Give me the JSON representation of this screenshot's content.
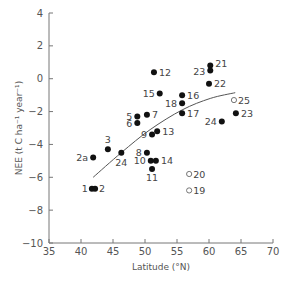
{
  "chart_data": {
    "type": "scatter",
    "title": "",
    "xlabel": "Latitude (°N)",
    "ylabel": "NEE (t C ha⁻¹ year⁻¹)",
    "xlim": [
      35,
      70
    ],
    "ylim": [
      -10,
      4
    ],
    "xticks": [
      35,
      40,
      45,
      50,
      55,
      60,
      65,
      70
    ],
    "yticks": [
      4,
      2,
      0,
      -2,
      -4,
      -6,
      -8,
      -10
    ],
    "grid": false,
    "legend": null,
    "series": [
      {
        "name": "filled",
        "marker": "filled-circle",
        "points": [
          {
            "label": "1",
            "x": 41.7,
            "y": -6.7
          },
          {
            "label": "2",
            "x": 42.2,
            "y": -6.7
          },
          {
            "label": "2a",
            "x": 41.9,
            "y": -4.8
          },
          {
            "label": "3",
            "x": 44.2,
            "y": -4.3
          },
          {
            "label": "24",
            "x": 46.3,
            "y": -4.5
          },
          {
            "label": "5",
            "x": 48.8,
            "y": -2.3
          },
          {
            "label": "6",
            "x": 48.8,
            "y": -2.7
          },
          {
            "label": "7",
            "x": 50.3,
            "y": -2.2
          },
          {
            "label": "8",
            "x": 50.3,
            "y": -4.5
          },
          {
            "label": "9",
            "x": 51.1,
            "y": -3.4
          },
          {
            "label": "10",
            "x": 50.9,
            "y": -5.0
          },
          {
            "label": "11",
            "x": 51.1,
            "y": -5.5
          },
          {
            "label": "12",
            "x": 51.4,
            "y": 0.4
          },
          {
            "label": "13",
            "x": 51.9,
            "y": -3.2
          },
          {
            "label": "14",
            "x": 51.7,
            "y": -5.0
          },
          {
            "label": "15",
            "x": 52.3,
            "y": -0.9
          },
          {
            "label": "16",
            "x": 55.8,
            "y": -1.0
          },
          {
            "label": "17",
            "x": 55.8,
            "y": -2.1
          },
          {
            "label": "18",
            "x": 55.8,
            "y": -1.5
          },
          {
            "label": "21",
            "x": 60.2,
            "y": 0.8
          },
          {
            "label": "23",
            "x": 60.2,
            "y": 0.5
          },
          {
            "label": "22",
            "x": 60.0,
            "y": -0.3
          },
          {
            "label": "23",
            "x": 64.2,
            "y": -2.1
          },
          {
            "label": "24",
            "x": 62.0,
            "y": -2.6
          }
        ]
      },
      {
        "name": "open",
        "marker": "open-circle",
        "points": [
          {
            "label": "19",
            "x": 56.9,
            "y": -6.8
          },
          {
            "label": "20",
            "x": 56.9,
            "y": -5.8
          },
          {
            "label": "25",
            "x": 63.9,
            "y": -1.3
          }
        ]
      }
    ],
    "fit_curve": {
      "type": "line",
      "points": [
        {
          "x": 41.9,
          "y": -6.0
        },
        {
          "x": 46.3,
          "y": -4.5
        },
        {
          "x": 50.8,
          "y": -3.1
        },
        {
          "x": 55.8,
          "y": -1.9
        },
        {
          "x": 60.2,
          "y": -1.2
        },
        {
          "x": 64.1,
          "y": -0.85
        }
      ]
    }
  }
}
